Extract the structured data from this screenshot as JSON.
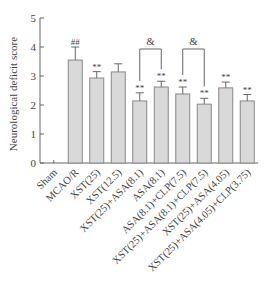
{
  "chart_data": {
    "type": "bar",
    "title": "",
    "xlabel": "",
    "ylabel": "Neurological deficit score",
    "ylim": [
      0,
      5
    ],
    "yticks": [
      0,
      1,
      2,
      3,
      4,
      5
    ],
    "grid": false,
    "legend": null,
    "categories": [
      "Sham",
      "MCAO/R",
      "XST(25)",
      "XST(12.5)",
      "XST(25)+ASA(8.1)",
      "ASA(8.1)",
      "ASA(8.1)+CLP(7.5)",
      "XST(25)+ASA(8.1)+CLP(7.5)",
      "XST(25)+ASA(4.05)",
      "XST(25)+ASA(4.05)+CLP(3.75)"
    ],
    "values": [
      0,
      3.55,
      2.93,
      3.14,
      2.14,
      2.62,
      2.38,
      2.03,
      2.59,
      2.14
    ],
    "errors": [
      0,
      0.45,
      0.22,
      0.28,
      0.28,
      0.2,
      0.24,
      0.2,
      0.2,
      0.22
    ],
    "annotations": [
      "",
      "##",
      "**",
      "",
      "**",
      "**",
      "**",
      "**",
      "**",
      "**"
    ],
    "brackets": [
      {
        "from": 4,
        "to": 5,
        "label": "&"
      },
      {
        "from": 6,
        "to": 7,
        "label": "&"
      }
    ],
    "bar_color": "#d9d9d9",
    "bar_edge": "#888888"
  }
}
